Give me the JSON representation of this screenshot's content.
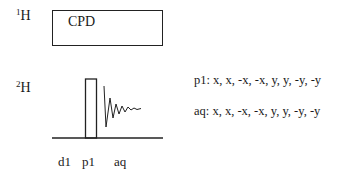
{
  "channels": [
    {
      "id": "1H",
      "mass": "1",
      "element": "H",
      "block_label": "CPD"
    },
    {
      "id": "2H",
      "mass": "2",
      "element": "H"
    }
  ],
  "phase_cycles": [
    {
      "name": "p1",
      "text": "p1: x, x, -x, -x, y, y, -y, -y"
    },
    {
      "name": "aq",
      "text": "aq: x, x, -x, -x, y, y, -y, -y"
    }
  ],
  "timing_labels": [
    "d1",
    "p1",
    "aq"
  ],
  "colors": {
    "line": "#222222",
    "background": "#ffffff"
  }
}
